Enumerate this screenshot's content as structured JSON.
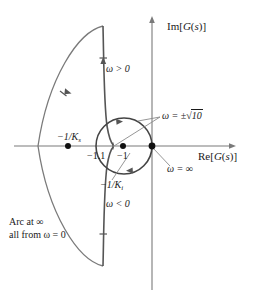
{
  "figure": {
    "type": "nyquist-plot",
    "axes": {
      "real_axis_label": "Re[G(s)]",
      "imag_axis_label": "Im[G(s)]",
      "origin_px": [
        152,
        146
      ]
    },
    "colors": {
      "curve": "#6e6e6e",
      "axis": "#6e6e6e",
      "text": "#1a1a1a",
      "marker": "#1a1a1a",
      "background": "#ffffff"
    },
    "annotations": {
      "omega_positive": "ω > 0",
      "omega_negative": "ω < 0",
      "omega_infinity": "ω = ∞",
      "omega_sqrt10_prefix": "ω = ±",
      "omega_sqrt10_radicand": "10",
      "point_minus_1_1": "−1.1",
      "point_minus_1": "−1",
      "gain_margin_upper_prefix": "−1/K",
      "gain_margin_upper_sub": "s",
      "gain_margin_lower_prefix": "−1/K",
      "gain_margin_lower_sub": "i",
      "arc_note_line1": "Arc at ∞",
      "arc_note_line2": "all from ω = 0"
    },
    "markers": [
      {
        "name": "gain-margin-dot",
        "x": 68,
        "y": 146
      },
      {
        "name": "circle-center-dot",
        "x": 123,
        "y": 146
      },
      {
        "name": "origin-dot",
        "x": 152,
        "y": 146
      }
    ],
    "circle": {
      "cx": 124,
      "cy": 146,
      "r": 28
    },
    "arc": {
      "leftmost_x": 38,
      "top_y": 26,
      "bottom_y": 266,
      "spine_x": 103
    }
  }
}
